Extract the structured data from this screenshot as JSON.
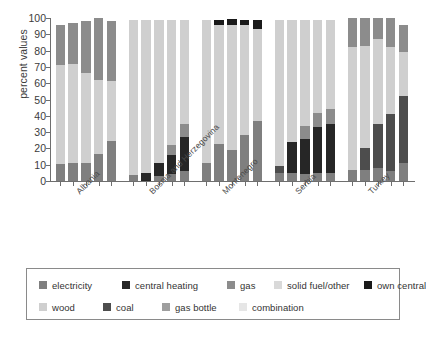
{
  "chart_data": {
    "type": "bar",
    "subtype": "stacked-grouped",
    "title": "",
    "xlabel": "",
    "ylabel": "percent values",
    "ylim": [
      0,
      100
    ],
    "yticks": [
      0,
      10,
      20,
      30,
      40,
      50,
      60,
      70,
      80,
      90,
      100
    ],
    "ytick_labels": [
      "0",
      "10",
      "20",
      "30",
      "40",
      "50",
      "60",
      "70",
      "80",
      "90",
      "100"
    ],
    "grid": false,
    "legend_position": "bottom",
    "categories": [
      "Albania",
      "Bosnia and Herzegovina",
      "Montenegro",
      "Serbia",
      "Turkey"
    ],
    "bars_per_category": 5,
    "series": [
      {
        "name": "electricity",
        "color": "#7f7f7f"
      },
      {
        "name": "central heating",
        "color": "#262626"
      },
      {
        "name": "gas",
        "color": "#8c8c8c"
      },
      {
        "name": "solid fuel/other",
        "color": "#d9d9d9"
      },
      {
        "name": "own central",
        "color": "#1a1a1a"
      },
      {
        "name": "wood",
        "color": "#cfcfcf"
      },
      {
        "name": "coal",
        "color": "#4d4d4d"
      },
      {
        "name": "gas bottle",
        "color": "#9e9e9e"
      },
      {
        "name": "combination",
        "color": "#e6e6e6"
      }
    ],
    "groups": [
      {
        "category": "Albania",
        "bars": [
          {
            "segments": [
              {
                "name": "electricity",
                "value": 10.5
              },
              {
                "name": "wood",
                "value": 60.5
              },
              {
                "name": "gas",
                "value": 24.8
              }
            ]
          },
          {
            "segments": [
              {
                "name": "electricity",
                "value": 11.0
              },
              {
                "name": "wood",
                "value": 61.0
              },
              {
                "name": "gas",
                "value": 25.0
              }
            ]
          },
          {
            "segments": [
              {
                "name": "electricity",
                "value": 11.0
              },
              {
                "name": "wood",
                "value": 55.0
              },
              {
                "name": "gas",
                "value": 32.0
              }
            ]
          },
          {
            "segments": [
              {
                "name": "electricity",
                "value": 16.5
              },
              {
                "name": "wood",
                "value": 45.5
              },
              {
                "name": "gas",
                "value": 38.0
              }
            ]
          },
          {
            "segments": [
              {
                "name": "electricity",
                "value": 24.5
              },
              {
                "name": "wood",
                "value": 37.0
              },
              {
                "name": "gas",
                "value": 36.5
              }
            ]
          }
        ]
      },
      {
        "category": "Bosnia and Herzegovina",
        "bars": [
          {
            "segments": [
              {
                "name": "electricity",
                "value": 3.5
              },
              {
                "name": "wood",
                "value": 95.5
              }
            ]
          },
          {
            "segments": [
              {
                "name": "central heating",
                "value": 5.0
              },
              {
                "name": "wood",
                "value": 94.0
              }
            ]
          },
          {
            "segments": [
              {
                "name": "electricity",
                "value": 3.0
              },
              {
                "name": "central heating",
                "value": 8.0
              },
              {
                "name": "wood",
                "value": 88.0
              }
            ]
          },
          {
            "segments": [
              {
                "name": "electricity",
                "value": 4.0
              },
              {
                "name": "central heating",
                "value": 12.0
              },
              {
                "name": "gas",
                "value": 6.0
              },
              {
                "name": "wood",
                "value": 77.0
              }
            ]
          },
          {
            "segments": [
              {
                "name": "electricity",
                "value": 6.0
              },
              {
                "name": "central heating",
                "value": 21.0
              },
              {
                "name": "gas",
                "value": 8.0
              },
              {
                "name": "wood",
                "value": 64.0
              }
            ]
          }
        ]
      },
      {
        "category": "Montenegro",
        "bars": [
          {
            "segments": [
              {
                "name": "electricity",
                "value": 11.0
              },
              {
                "name": "wood",
                "value": 88.0
              }
            ]
          },
          {
            "segments": [
              {
                "name": "electricity",
                "value": 23.0
              },
              {
                "name": "wood",
                "value": 73.0
              },
              {
                "name": "own central",
                "value": 3.0
              }
            ]
          },
          {
            "segments": [
              {
                "name": "electricity",
                "value": 19.0
              },
              {
                "name": "wood",
                "value": 77.0
              },
              {
                "name": "own central",
                "value": 3.5
              }
            ]
          },
          {
            "segments": [
              {
                "name": "electricity",
                "value": 28.0
              },
              {
                "name": "wood",
                "value": 68.0
              },
              {
                "name": "own central",
                "value": 3.0
              }
            ]
          },
          {
            "segments": [
              {
                "name": "electricity",
                "value": 37.0
              },
              {
                "name": "wood",
                "value": 56.0
              },
              {
                "name": "own central",
                "value": 6.0
              }
            ]
          }
        ]
      },
      {
        "category": "Serbia",
        "bars": [
          {
            "segments": [
              {
                "name": "electricity",
                "value": 5.0
              },
              {
                "name": "coal",
                "value": 4.5
              },
              {
                "name": "wood",
                "value": 89.5
              }
            ]
          },
          {
            "segments": [
              {
                "name": "electricity",
                "value": 5.0
              },
              {
                "name": "central heating",
                "value": 19.0
              },
              {
                "name": "wood",
                "value": 75.0
              }
            ]
          },
          {
            "segments": [
              {
                "name": "electricity",
                "value": 4.0
              },
              {
                "name": "central heating",
                "value": 22.0
              },
              {
                "name": "gas",
                "value": 8.0
              },
              {
                "name": "wood",
                "value": 65.0
              }
            ]
          },
          {
            "segments": [
              {
                "name": "electricity",
                "value": 5.0
              },
              {
                "name": "central heating",
                "value": 28.0
              },
              {
                "name": "gas",
                "value": 9.0
              },
              {
                "name": "wood",
                "value": 57.0
              }
            ]
          },
          {
            "segments": [
              {
                "name": "electricity",
                "value": 5.0
              },
              {
                "name": "central heating",
                "value": 30.0
              },
              {
                "name": "gas",
                "value": 9.0
              },
              {
                "name": "wood",
                "value": 55.0
              }
            ]
          }
        ]
      },
      {
        "category": "Turkey",
        "bars": [
          {
            "segments": [
              {
                "name": "electricity",
                "value": 7.0
              },
              {
                "name": "wood",
                "value": 75.0
              },
              {
                "name": "gas",
                "value": 18.0
              }
            ]
          },
          {
            "segments": [
              {
                "name": "electricity",
                "value": 7.0
              },
              {
                "name": "coal",
                "value": 13.0
              },
              {
                "name": "wood",
                "value": 63.0
              },
              {
                "name": "gas",
                "value": 17.0
              }
            ]
          },
          {
            "segments": [
              {
                "name": "electricity",
                "value": 8.0
              },
              {
                "name": "coal",
                "value": 27.0
              },
              {
                "name": "wood",
                "value": 52.0
              },
              {
                "name": "gas",
                "value": 13.0
              }
            ]
          },
          {
            "segments": [
              {
                "name": "electricity",
                "value": 6.0
              },
              {
                "name": "coal",
                "value": 35.0
              },
              {
                "name": "wood",
                "value": 41.0
              },
              {
                "name": "gas",
                "value": 18.0
              }
            ]
          },
          {
            "segments": [
              {
                "name": "electricity",
                "value": 11.0
              },
              {
                "name": "coal",
                "value": 41.0
              },
              {
                "name": "wood",
                "value": 27.0
              },
              {
                "name": "gas",
                "value": 17.0
              }
            ]
          }
        ]
      }
    ]
  },
  "axis": {
    "ylabel": "percent values",
    "ytick_labels": [
      "100",
      "90",
      "80",
      "70",
      "60",
      "50",
      "40",
      "30",
      "20",
      "10",
      "0"
    ]
  },
  "xlabels": [
    "Albania",
    "Bosnia and Herzegovina",
    "Montenegro",
    "Serbia",
    "Turkey"
  ],
  "legend": {
    "row1": [
      {
        "label": "electricity",
        "color": "#7f7f7f"
      },
      {
        "label": "central heating",
        "color": "#262626"
      },
      {
        "label": "gas",
        "color": "#8c8c8c"
      },
      {
        "label": "solid fuel/other",
        "color": "#d9d9d9"
      },
      {
        "label": "own central",
        "color": "#1a1a1a"
      }
    ],
    "row2": [
      {
        "label": "wood",
        "color": "#cfcfcf"
      },
      {
        "label": "coal",
        "color": "#4d4d4d"
      },
      {
        "label": "gas bottle",
        "color": "#9e9e9e"
      },
      {
        "label": "combination",
        "color": "#e6e6e6"
      }
    ]
  }
}
